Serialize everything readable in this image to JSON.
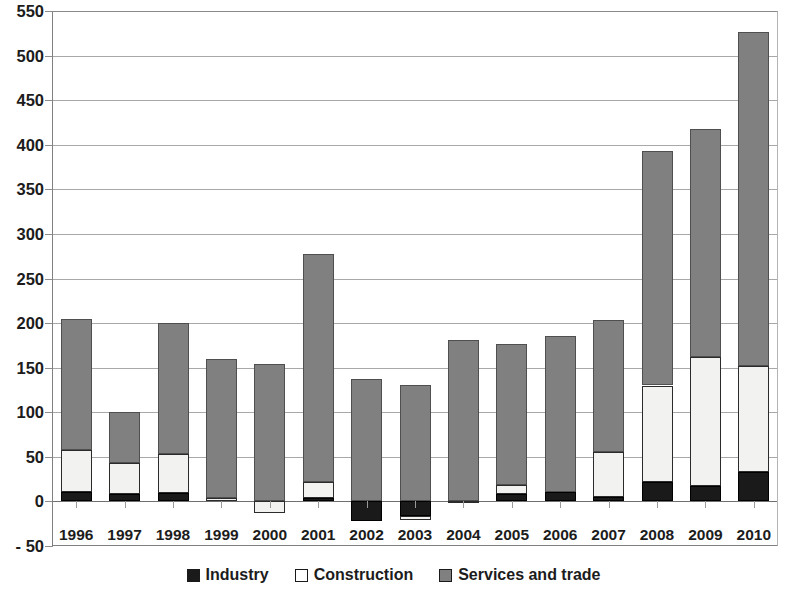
{
  "chart_data": {
    "type": "bar",
    "subtype": "stacked-bar",
    "title": "",
    "xlabel": "",
    "ylabel": "",
    "ylim": [
      -50,
      550
    ],
    "ytick_step": 50,
    "yticks": [
      550,
      500,
      450,
      400,
      350,
      300,
      250,
      200,
      150,
      100,
      50,
      0,
      -50
    ],
    "ytick_labels": [
      "550",
      "500",
      "450",
      "400",
      "350",
      "300",
      "250",
      "200",
      "150",
      "100",
      "50",
      "0",
      "- 50"
    ],
    "grid": true,
    "grid_axis": "y",
    "legend_position": "bottom",
    "categories": [
      "1996",
      "1997",
      "1998",
      "1999",
      "2000",
      "2001",
      "2002",
      "2003",
      "2004",
      "2005",
      "2006",
      "2007",
      "2008",
      "2009",
      "2010"
    ],
    "series": [
      {
        "name": "Industry",
        "color": "#1a1a1a",
        "values": [
          11,
          8,
          9,
          0,
          0,
          4,
          -22,
          -16,
          0,
          8,
          11,
          5,
          22,
          17,
          33
        ]
      },
      {
        "name": "Construction",
        "color": "#ffffff",
        "values": [
          47,
          35,
          44,
          4,
          -13,
          18,
          0,
          -5,
          1,
          10,
          0,
          50,
          108,
          145,
          119
        ]
      },
      {
        "name": "Services and trade",
        "color": "#808080",
        "values": [
          147,
          57,
          147,
          156,
          154,
          256,
          137,
          131,
          180,
          158,
          174,
          148,
          263,
          256,
          374
        ]
      }
    ],
    "totals": [
      205,
      100,
      200,
      160,
      141,
      278,
      115,
      110,
      181,
      176,
      185,
      203,
      393,
      418,
      526
    ]
  },
  "legend": {
    "items": [
      {
        "label": "Industry",
        "swatch": "industry"
      },
      {
        "label": "Construction",
        "swatch": "construction"
      },
      {
        "label": "Services and trade",
        "swatch": "services"
      }
    ]
  }
}
